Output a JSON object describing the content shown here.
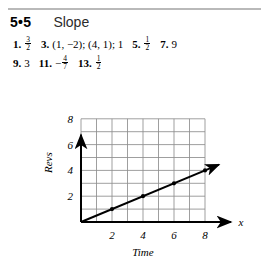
{
  "header": {
    "section_number": "5•5",
    "title": "Slope"
  },
  "answers": {
    "line1": [
      {
        "num": "1.",
        "value": "3/2",
        "type": "fraction",
        "numerator": "3",
        "denominator": "2",
        "sign": ""
      },
      {
        "num": "3.",
        "value": "(1, −2); (4, 1); 1",
        "type": "text"
      },
      {
        "num": "5.",
        "value": "1/2",
        "type": "fraction",
        "numerator": "1",
        "denominator": "2",
        "sign": ""
      },
      {
        "num": "7.",
        "value": "9",
        "type": "text"
      }
    ],
    "line2": [
      {
        "num": "9.",
        "value": "3",
        "type": "text"
      },
      {
        "num": "11.",
        "value": "-4/7",
        "type": "fraction",
        "numerator": "4",
        "denominator": "7",
        "sign": "−"
      },
      {
        "num": "13.",
        "value": "1/2",
        "type": "fraction",
        "numerator": "1",
        "denominator": "2",
        "sign": ""
      }
    ]
  },
  "chart_data": {
    "type": "line",
    "title": "",
    "xlabel": "Time",
    "ylabel": "Revs",
    "axis_end_label": "x",
    "xlim": [
      0,
      8
    ],
    "ylim": [
      0,
      8
    ],
    "grid": true,
    "grid_step": 1,
    "xticks": [
      2,
      4,
      6,
      8
    ],
    "xtick_labels": [
      "2",
      "4",
      "6",
      "8"
    ],
    "yticks": [
      2,
      4,
      6,
      8
    ],
    "ytick_labels": [
      "2",
      "4",
      "6",
      "8"
    ],
    "series": [
      {
        "name": "Revs vs Time",
        "slope": 0.5,
        "intercept": 0,
        "line_from": [
          0,
          0
        ],
        "line_to": [
          8.9,
          4.45
        ],
        "arrow_end": true,
        "points": [
          [
            2,
            1
          ],
          [
            4,
            2
          ],
          [
            6,
            3
          ],
          [
            8,
            4
          ]
        ]
      }
    ]
  },
  "colors": {
    "ink": "#000000",
    "rule": "#b9b9b9",
    "grid": "#8e8e8e",
    "page": "#ffffff"
  }
}
